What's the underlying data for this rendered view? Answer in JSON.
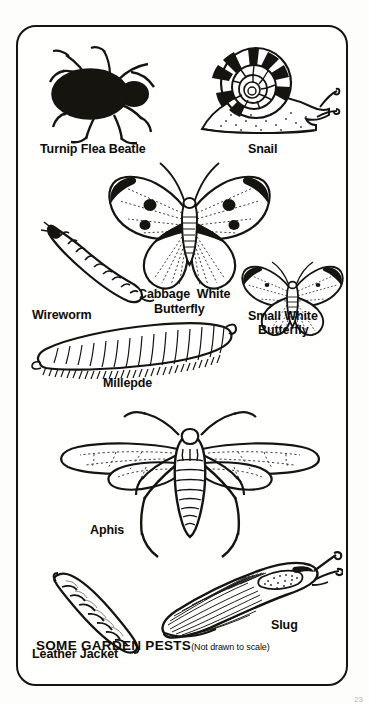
{
  "plate": {
    "caption_main": "SOME GARDEN PESTS",
    "caption_sub": "(Not drawn to scale)",
    "page_number": "23"
  },
  "figures": [
    {
      "id": "turnip-flea-beatle",
      "label": "Turnip Flea Beatle"
    },
    {
      "id": "snail",
      "label": "Snail"
    },
    {
      "id": "wireworm",
      "label": "Wireworm"
    },
    {
      "id": "cabbage-white-butterfly",
      "label_line1": "Cabbage  White",
      "label_line2": "Butterfly"
    },
    {
      "id": "small-white-butterfly",
      "label_line1": "Small White",
      "label_line2": "Butterfly"
    },
    {
      "id": "millepde",
      "label": "Millepde"
    },
    {
      "id": "aphis",
      "label": "Aphis"
    },
    {
      "id": "leather-jacket",
      "label": "Leather Jacket"
    },
    {
      "id": "slug",
      "label": "Slug"
    }
  ],
  "colors": {
    "ink": "#16140f",
    "paper": "#fffffd",
    "page_background": "#fdfdfb"
  }
}
